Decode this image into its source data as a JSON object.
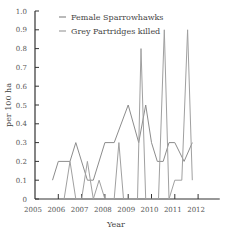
{
  "chart_data": {
    "type": "line",
    "title": "",
    "xlabel": "Year",
    "ylabel": "per 100 ha",
    "xlim": [
      2005,
      2012.8
    ],
    "ylim": [
      0,
      1.0
    ],
    "xticks": [
      "2005",
      "2006",
      "2007",
      "2008",
      "2009",
      "2010",
      "2011",
      "2012"
    ],
    "yticks": [
      "0",
      "0.1",
      "0.2",
      "0.3",
      "0.4",
      "0.5",
      "0.6",
      "0.7",
      "0.8",
      "0.9",
      "1.0"
    ],
    "grid": false,
    "legend_position": "top-right",
    "series": [
      {
        "name": "Female Sparrowhawks",
        "color": "#8c8c8c",
        "x": [
          2005.75,
          2006.0,
          2006.5,
          2006.75,
          2007.25,
          2007.5,
          2008.0,
          2008.4,
          2009.0,
          2009.45,
          2009.75,
          2010.0,
          2010.25,
          2010.5,
          2010.75,
          2011.0,
          2011.4,
          2011.75
        ],
        "values": [
          0.1,
          0.2,
          0.2,
          0.3,
          0.1,
          0.1,
          0.3,
          0.3,
          0.5,
          0.3,
          0.5,
          0.3,
          0.2,
          0.2,
          0.3,
          0.3,
          0.2,
          0.3
        ]
      },
      {
        "name": "Grey Partridges killed",
        "color": "#a0a0a0",
        "x": [
          2006.25,
          2006.5,
          2006.75,
          2007.0,
          2007.25,
          2007.5,
          2007.75,
          2008.0,
          2008.4,
          2008.6,
          2008.8,
          2009.4,
          2009.55,
          2009.75,
          2010.3,
          2010.55,
          2010.75,
          2011.0,
          2011.3,
          2011.55,
          2011.75
        ],
        "values": [
          0,
          0.2,
          0,
          0,
          0.2,
          0,
          0.1,
          0,
          0,
          0.3,
          0,
          0,
          0.8,
          0,
          0,
          0.9,
          0,
          0.1,
          0.1,
          0.9,
          0.1
        ]
      }
    ]
  }
}
